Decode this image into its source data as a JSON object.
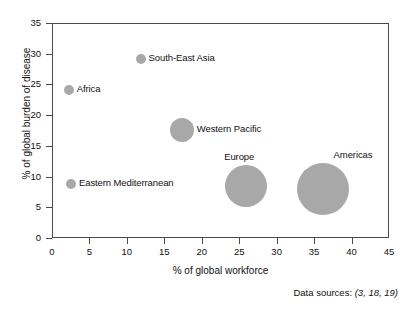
{
  "chart_data": {
    "type": "scatter",
    "title": "",
    "xlabel": "% of global workforce",
    "ylabel": "% of global burden of disease",
    "xlim": [
      0,
      45
    ],
    "ylim": [
      0,
      35
    ],
    "xticks": [
      0,
      5,
      10,
      15,
      20,
      25,
      30,
      35,
      40,
      45
    ],
    "yticks": [
      0,
      5,
      10,
      15,
      20,
      25,
      30,
      35
    ],
    "grid": false,
    "legend": "none",
    "bubble_color": "#a8a8a8",
    "axis_color": "#4a4a4a",
    "points": [
      {
        "label": "Africa",
        "x": 2.1,
        "y": 24.3,
        "radius_px": 5,
        "label_side": "right"
      },
      {
        "label": "South-East Asia",
        "x": 11.7,
        "y": 29.3,
        "radius_px": 5,
        "label_side": "right"
      },
      {
        "label": "Western Pacific",
        "x": 17.2,
        "y": 17.8,
        "radius_px": 12,
        "label_side": "right"
      },
      {
        "label": "Eastern Mediterranean",
        "x": 2.4,
        "y": 9.0,
        "radius_px": 5,
        "label_side": "right"
      },
      {
        "label": "Europe",
        "x": 25.8,
        "y": 8.6,
        "radius_px": 21,
        "label_side": "above"
      },
      {
        "label": "Americas",
        "x": 36.0,
        "y": 8.1,
        "radius_px": 26,
        "label_side": "above-right"
      }
    ],
    "annotations": [
      {
        "name": "data-sources",
        "prefix": "Data sources: ",
        "citation": "(3, 18, 19)"
      }
    ]
  }
}
